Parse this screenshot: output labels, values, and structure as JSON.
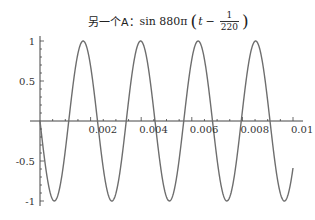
{
  "title": {
    "prefix": "另一个A：",
    "func": "sin 880π",
    "var": "t",
    "minus": "−",
    "frac_num": "1",
    "frac_den": "220",
    "open_paren": "(",
    "close_paren": ")"
  },
  "chart_data": {
    "type": "line",
    "xlabel": "",
    "ylabel": "",
    "xlim": [
      0,
      0.01
    ],
    "ylim": [
      -1,
      1
    ],
    "x_ticks": [
      {
        "value": 0.002,
        "label": "0.002"
      },
      {
        "value": 0.004,
        "label": "0.004"
      },
      {
        "value": 0.006,
        "label": "0.006"
      },
      {
        "value": 0.008,
        "label": "0.008"
      },
      {
        "value": 0.01,
        "label": "0.01"
      }
    ],
    "y_ticks": [
      {
        "value": 1,
        "label": "1"
      },
      {
        "value": 0.5,
        "label": "0.5"
      },
      {
        "value": -0.5,
        "label": "-0.5"
      },
      {
        "value": -1,
        "label": "-1"
      }
    ],
    "grid": false,
    "legend": null,
    "series": [
      {
        "name": "sin 880π (t − 1/220)",
        "function": "-sin(880*pi*t)",
        "frequency_hz": 440,
        "period": 0.002273,
        "amplitude": 1,
        "samples": {
          "x": [
            0,
            0.000568,
            0.001136,
            0.001705,
            0.002273,
            0.002841,
            0.003409,
            0.003977,
            0.004545,
            0.005114,
            0.005682,
            0.00625,
            0.006818,
            0.007386,
            0.007955,
            0.008523,
            0.009091,
            0.009659,
            0.01
          ],
          "y": [
            0,
            -1,
            0,
            1,
            0,
            -1,
            0,
            1,
            0,
            -1,
            0,
            1,
            0,
            -1,
            0,
            1,
            0,
            -1,
            -0.588
          ]
        }
      }
    ],
    "colors": {
      "curve": "#6e6e6e",
      "axis": "#444444"
    }
  }
}
